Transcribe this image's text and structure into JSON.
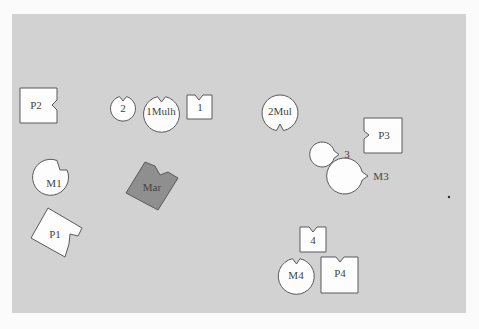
{
  "board": {
    "background": "#fbfbfb",
    "panel_color": "#d2d2d2",
    "piece_fill": "#fdfdfd",
    "marker_fill": "#8f8f8f",
    "outline": "#5a5a5a"
  },
  "pieces": [
    {
      "id": "P2",
      "label": "P2",
      "shape": "square-notch-right"
    },
    {
      "id": "2",
      "label": "2",
      "shape": "circle-notch-top"
    },
    {
      "id": "1Mulh",
      "label": "1Mulh",
      "shape": "circle-notch-top"
    },
    {
      "id": "1",
      "label": "1",
      "shape": "square-notch-top"
    },
    {
      "id": "2Mul",
      "label": "2Mul",
      "shape": "circle-notch-bottom"
    },
    {
      "id": "P3",
      "label": "P3",
      "shape": "square-notch-left"
    },
    {
      "id": "3",
      "label": "3",
      "shape": "circle-notch-left"
    },
    {
      "id": "M3",
      "label": "M3",
      "shape": "circle-notch-left"
    },
    {
      "id": "M1",
      "label": "M1",
      "shape": "circle-notch-topright"
    },
    {
      "id": "Mar",
      "label": "Mar",
      "shape": "square-notch-rotated"
    },
    {
      "id": "P1",
      "label": "P1",
      "shape": "square-notch-rotated"
    },
    {
      "id": "4",
      "label": "4",
      "shape": "square-notch-top"
    },
    {
      "id": "M4",
      "label": "M4",
      "shape": "circle-notch-top"
    },
    {
      "id": "P4",
      "label": "P4",
      "shape": "square-notch-top"
    }
  ]
}
